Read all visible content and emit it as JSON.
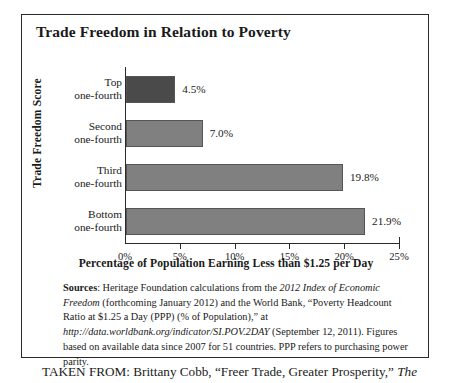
{
  "figure": {
    "title": "Trade Freedom in Relation to Poverty",
    "sources_label": "Sources",
    "sources_text_1": ": Heritage Foundation calculations from the ",
    "sources_italic_1": "2012 Index of Economic Freedom",
    "sources_text_2": " (forthcoming January 2012) and the World Bank, “Poverty Headcount Ratio at $1.25 a Day (PPP) (% of Population),” at ",
    "sources_italic_2": "http://data.worldbank.org/indicator/SI.POV.2DAY",
    "sources_text_3": " (September 12, 2011). Figures based on available data since 2007 for 51 countries. PPP refers to purchasing power parity.",
    "taken_from_text": "TAKEN FROM: Brittany Cobb, “Freer Trade, Greater Prosperity,” ",
    "taken_from_italic": "The"
  },
  "chart_data": {
    "type": "bar",
    "orientation": "horizontal",
    "title": "Trade Freedom in Relation to Poverty",
    "xlabel": "Percentage of Population Earning Less than $1.25 per Day",
    "ylabel": "Trade Freedom Score",
    "categories": [
      "Top one-fourth",
      "Second one-fourth",
      "Third one-fourth",
      "Bottom one-fourth"
    ],
    "category_lines": [
      [
        "Top",
        "one-fourth"
      ],
      [
        "Second",
        "one-fourth"
      ],
      [
        "Third",
        "one-fourth"
      ],
      [
        "Bottom",
        "one-fourth"
      ]
    ],
    "values": [
      4.5,
      7.0,
      19.8,
      21.9
    ],
    "value_labels": [
      "4.5%",
      "7.0%",
      "19.8%",
      "21.9%"
    ],
    "bar_colors": [
      "#4a4a4a",
      "#808080",
      "#808080",
      "#808080"
    ],
    "xlim": [
      0,
      25
    ],
    "xticks": [
      0,
      5,
      10,
      15,
      20,
      25
    ],
    "xtick_labels": [
      "0%",
      "5%",
      "10%",
      "15%",
      "20%",
      "25%"
    ],
    "grid": false,
    "legend": "none"
  }
}
